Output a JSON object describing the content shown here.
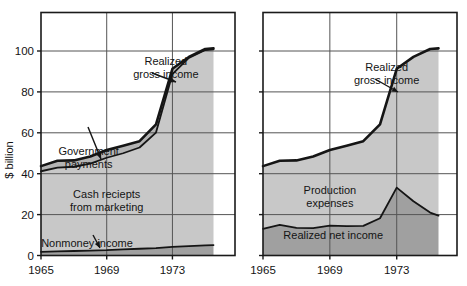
{
  "figure": {
    "axis_title_y": "$ billion",
    "panels": [
      {
        "id": "left",
        "y_ticks": [
          "0",
          "20",
          "40",
          "60",
          "80",
          "100"
        ],
        "y_tick_values": [
          0,
          20,
          40,
          60,
          80,
          100
        ],
        "x_ticks": [
          "1965",
          "1969",
          "1973"
        ],
        "x_tick_values": [
          1965,
          1969,
          1973
        ],
        "annotations": [
          {
            "name": "realized-gross-income",
            "lines": [
              "Realized",
              "gross income"
            ]
          },
          {
            "name": "government-payments",
            "lines": [
              "Government",
              "payments"
            ]
          },
          {
            "name": "cash-receipts-from-marketing",
            "lines": [
              "Cash reciepts",
              "from marketing"
            ]
          },
          {
            "name": "nonmoney-income",
            "lines": [
              "Nonmoney income"
            ]
          }
        ]
      },
      {
        "id": "right",
        "y_ticks": [
          "",
          "",
          "",
          "",
          "",
          ""
        ],
        "y_tick_values": [
          0,
          20,
          40,
          60,
          80,
          100
        ],
        "x_ticks": [
          "1965",
          "1969",
          "1973"
        ],
        "x_tick_values": [
          1965,
          1969,
          1973
        ],
        "annotations": [
          {
            "name": "realized-gross-income",
            "lines": [
              "Realized",
              "gross income"
            ]
          },
          {
            "name": "production-expenses",
            "lines": [
              "Production",
              "expenses"
            ]
          },
          {
            "name": "realized-net-income",
            "lines": [
              "Realized net income"
            ]
          }
        ]
      }
    ]
  },
  "colors": {
    "line": "#151515",
    "frame": "#1a1a1a",
    "grid": "#555555",
    "band_light": "#c8c8c8",
    "band_mid": "#b4b4b4",
    "band_dark": "#a0a0a0",
    "background": "#ffffff"
  },
  "chart_data": {
    "type": "area",
    "title": "",
    "subtitle": "",
    "xlabel": "",
    "ylabel": "$ billion",
    "xlim": [
      1965,
      1975.5
    ],
    "ylim": [
      0,
      115
    ],
    "grid": true,
    "legend": "annotations-inline",
    "panels": [
      {
        "name": "Farm income sources",
        "stacked": true,
        "x": [
          1965,
          1966,
          1967,
          1968,
          1969,
          1970,
          1971,
          1972,
          1973,
          1974,
          1975,
          1975.5
        ],
        "series": [
          {
            "name": "Nonmoney income",
            "values": [
              1.8,
              2.0,
              2.2,
              2.4,
              2.6,
              3.0,
              3.3,
              3.6,
              4.2,
              4.6,
              5.0,
              5.1
            ]
          },
          {
            "name": "Cash reciepts from marketing",
            "values": [
              39.4,
              41.0,
              41.2,
              42.5,
              45.2,
              47.0,
              49.5,
              56.5,
              84.5,
              92.0,
              95.5,
              95.7
            ]
          },
          {
            "name": "Government payments",
            "values": [
              2.5,
              3.3,
              3.1,
              3.5,
              3.8,
              3.7,
              3.1,
              4.0,
              2.6,
              0.5,
              0.5,
              0.5
            ]
          }
        ],
        "totals_label": "Realized gross income",
        "totals": [
          43.7,
          46.3,
          46.5,
          48.4,
          51.6,
          53.7,
          55.9,
          64.1,
          91.3,
          97.1,
          101.0,
          101.3
        ],
        "annotations": [
          {
            "text": "Realized gross income",
            "at_x": 1972.6,
            "at_y": 93.0
          },
          {
            "text": "Government payments",
            "at_x": 1967.9,
            "at_y": 49.0
          },
          {
            "text": "Cash reciepts from marketing",
            "at_x": 1969.0,
            "at_y": 28.0
          },
          {
            "text": "Nonmoney income",
            "at_x": 1967.8,
            "at_y": 4.0
          }
        ]
      },
      {
        "name": "Farm income disposition",
        "stacked": true,
        "x": [
          1965,
          1966,
          1967,
          1968,
          1969,
          1970,
          1971,
          1972,
          1973,
          1974,
          1975,
          1975.5
        ],
        "series": [
          {
            "name": "Realized net income",
            "values": [
              13.0,
              15.0,
              13.5,
              13.4,
              14.6,
              14.4,
              14.5,
              18.2,
              33.2,
              26.5,
              21.0,
              19.5
            ]
          },
          {
            "name": "Production expenses",
            "values": [
              30.7,
              31.3,
              33.0,
              35.0,
              37.0,
              39.3,
              41.4,
              45.9,
              58.1,
              70.6,
              80.0,
              81.8
            ]
          }
        ],
        "totals_label": "Realized gross income",
        "totals": [
          43.7,
          46.3,
          46.5,
          48.4,
          51.6,
          53.7,
          55.9,
          64.1,
          91.3,
          97.1,
          101.0,
          101.3
        ],
        "annotations": [
          {
            "text": "Realized gross income",
            "at_x": 1972.4,
            "at_y": 90.0
          },
          {
            "text": "Production expenses",
            "at_x": 1969.0,
            "at_y": 30.0
          },
          {
            "text": "Realized net income",
            "at_x": 1969.2,
            "at_y": 8.0
          }
        ]
      }
    ]
  }
}
